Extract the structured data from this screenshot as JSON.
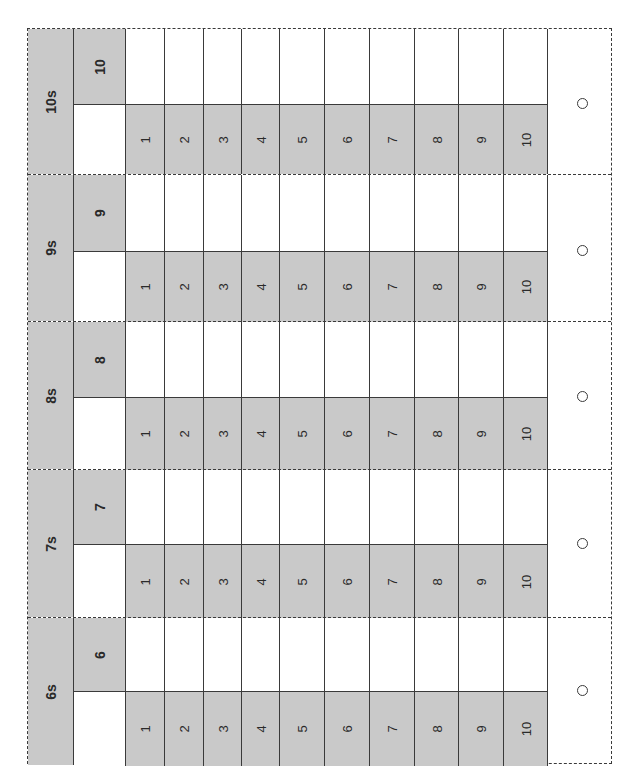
{
  "worksheet": {
    "title": "Times tables practice",
    "orientation": "rotated -90deg",
    "colors": {
      "fill_gray": "#c9c9c9",
      "line": "#3a3a3a",
      "background": "#ffffff"
    },
    "sections": [
      {
        "label": "10s",
        "multiplier": "10",
        "factors": [
          "1",
          "2",
          "3",
          "4",
          "5",
          "6",
          "7",
          "8",
          "9",
          "10"
        ],
        "answers": [
          "",
          "",
          "",
          "",
          "",
          "",
          "",
          "",
          "",
          ""
        ],
        "check_mark": "○"
      },
      {
        "label": "9s",
        "multiplier": "9",
        "factors": [
          "1",
          "2",
          "3",
          "4",
          "5",
          "6",
          "7",
          "8",
          "9",
          "10"
        ],
        "answers": [
          "",
          "",
          "",
          "",
          "",
          "",
          "",
          "",
          "",
          ""
        ],
        "check_mark": "○"
      },
      {
        "label": "8s",
        "multiplier": "8",
        "factors": [
          "1",
          "2",
          "3",
          "4",
          "5",
          "6",
          "7",
          "8",
          "9",
          "10"
        ],
        "answers": [
          "",
          "",
          "",
          "",
          "",
          "",
          "",
          "",
          "",
          ""
        ],
        "check_mark": "○"
      },
      {
        "label": "7s",
        "multiplier": "7",
        "factors": [
          "1",
          "2",
          "3",
          "4",
          "5",
          "6",
          "7",
          "8",
          "9",
          "10"
        ],
        "answers": [
          "",
          "",
          "",
          "",
          "",
          "",
          "",
          "",
          "",
          ""
        ],
        "check_mark": "○"
      },
      {
        "label": "6s",
        "multiplier": "6",
        "factors": [
          "1",
          "2",
          "3",
          "4",
          "5",
          "6",
          "7",
          "8",
          "9",
          "10"
        ],
        "answers": [
          "",
          "",
          "",
          "",
          "",
          "",
          "",
          "",
          "",
          ""
        ],
        "check_mark": "○"
      }
    ]
  }
}
